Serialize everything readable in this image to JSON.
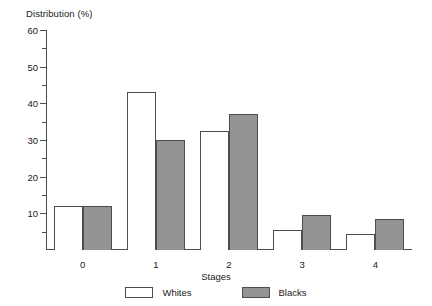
{
  "chart_data": {
    "type": "bar",
    "title": "",
    "ylabel": "Distribution (%)",
    "xlabel": "Stages",
    "categories": [
      "0",
      "1",
      "2",
      "3",
      "4"
    ],
    "series": [
      {
        "name": "Whites",
        "color": "#ffffff",
        "values": [
          12,
          43,
          32.5,
          5.5,
          4.5
        ]
      },
      {
        "name": "Blacks",
        "color": "#949494",
        "values": [
          12,
          30,
          37,
          9.5,
          8.5
        ]
      }
    ],
    "ylim": [
      0,
      60
    ],
    "ytick_labels": [
      "10",
      "20",
      "30",
      "40",
      "50",
      "60"
    ],
    "ytick_values": [
      10,
      20,
      30,
      40,
      50,
      60
    ],
    "yminor_values": [
      5,
      15,
      25,
      35,
      45,
      55
    ],
    "grid": false,
    "legend_position": "bottom",
    "legend": [
      {
        "label": "Whites",
        "swatch": "open-box"
      },
      {
        "label": "Blacks",
        "swatch": "filled-box"
      }
    ]
  }
}
